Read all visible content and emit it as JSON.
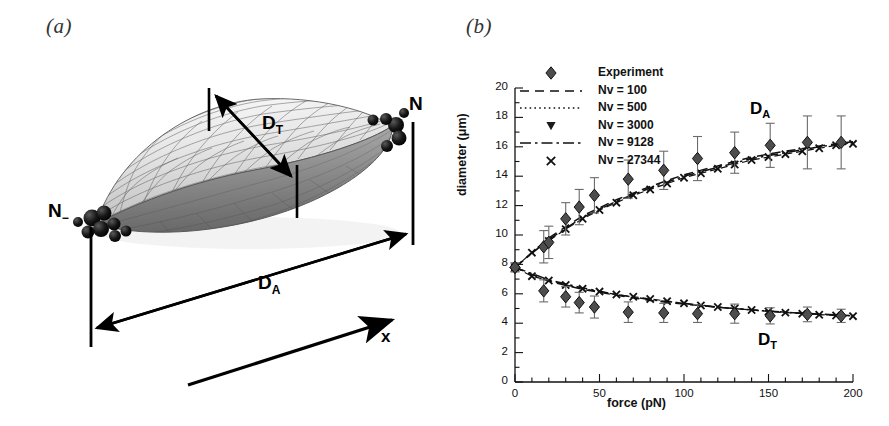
{
  "figure": {
    "panel_a_label": "(a)",
    "panel_b_label": "(b)"
  },
  "panel_a": {
    "caption": "3D triangulated mesh of a stretched cell (ellipsoidal/spindle membrane surface) with attached bead clusters at both poles",
    "labels": {
      "node_right": "N",
      "node_right_sub": "+",
      "node_left": "N",
      "node_left_sub": "−",
      "transverse_diameter": "D",
      "transverse_diameter_sub": "T",
      "axial_diameter": "D",
      "axial_diameter_sub": "A",
      "axis_arrow": "x"
    },
    "colors": {
      "mesh_line": "#4a4a4a",
      "surface_light": "#f2f2f2",
      "surface_mid": "#c8c8c8",
      "surface_dark": "#777777",
      "bead": "#111111",
      "arrow": "#000000"
    }
  },
  "chart_data": {
    "type": "scatter",
    "title": "",
    "xlabel": "force (pN)",
    "ylabel": "diameter (μm)",
    "xlim": [
      0,
      200
    ],
    "ylim": [
      0,
      20
    ],
    "xticks": [
      0,
      50,
      100,
      150,
      200
    ],
    "xticklabels": [
      "0",
      "50",
      "100",
      "150",
      "200"
    ],
    "xminor_step": 10,
    "yticks": [
      0,
      2,
      4,
      6,
      8,
      10,
      12,
      14,
      16,
      18,
      20
    ],
    "yticklabels": [
      "0",
      "2",
      "4",
      "6",
      "8",
      "10",
      "12",
      "14",
      "16",
      "18",
      "20"
    ],
    "yminor_step": 1,
    "grid": false,
    "legend_position": "top-left",
    "annotations": [
      {
        "text": "D",
        "sub": "A",
        "x": 150,
        "y": 18.4
      },
      {
        "text": "D",
        "sub": "T",
        "x": 155,
        "y": 2.6
      }
    ],
    "legend": [
      {
        "label": "Experiment",
        "marker": "diamond",
        "linestyle": "none"
      },
      {
        "label": "Nv = 100",
        "marker": "none",
        "linestyle": "dashed"
      },
      {
        "label": "Nv = 500",
        "marker": "none",
        "linestyle": "dotted"
      },
      {
        "label": "Nv = 3000",
        "marker": "triangle-down",
        "linestyle": "none"
      },
      {
        "label": "Nv = 9128",
        "marker": "none",
        "linestyle": "dashdot"
      },
      {
        "label": "Nv = 27344",
        "marker": "x",
        "linestyle": "none"
      }
    ],
    "series": [
      {
        "name": "D_A Experiment",
        "marker": "diamond",
        "branch": "axial",
        "x": [
          0,
          17,
          20,
          30,
          38,
          47,
          67,
          88,
          108,
          130,
          151,
          173,
          193
        ],
        "y": [
          7.8,
          9.2,
          9.5,
          11.1,
          11.9,
          12.7,
          13.8,
          14.4,
          15.2,
          15.6,
          16.1,
          16.3,
          16.3
        ],
        "yerr": [
          0.3,
          1.1,
          1.1,
          1.1,
          1.2,
          1.2,
          1.3,
          1.3,
          1.5,
          1.4,
          1.5,
          1.8,
          1.8
        ]
      },
      {
        "name": "D_T Experiment",
        "marker": "diamond",
        "branch": "transverse",
        "x": [
          0,
          17,
          30,
          38,
          47,
          67,
          88,
          108,
          130,
          151,
          173,
          193
        ],
        "y": [
          7.8,
          6.2,
          5.8,
          5.4,
          5.1,
          4.75,
          4.7,
          4.65,
          4.65,
          4.5,
          4.6,
          4.5
        ],
        "yerr": [
          0.3,
          0.75,
          0.7,
          0.7,
          0.75,
          0.7,
          0.65,
          0.6,
          0.65,
          0.55,
          0.5,
          0.45
        ]
      },
      {
        "name": "D_A Nv = 27344",
        "marker": "x",
        "branch": "axial",
        "x": [
          0,
          10,
          20,
          30,
          40,
          50,
          60,
          70,
          80,
          90,
          100,
          110,
          120,
          130,
          140,
          150,
          160,
          170,
          180,
          190,
          200
        ],
        "y": [
          7.8,
          8.8,
          9.6,
          10.4,
          11.1,
          11.7,
          12.2,
          12.7,
          13.1,
          13.5,
          13.9,
          14.2,
          14.5,
          14.8,
          15.1,
          15.3,
          15.5,
          15.7,
          15.9,
          16.1,
          16.2
        ]
      },
      {
        "name": "D_T Nv = 27344",
        "marker": "x",
        "branch": "transverse",
        "x": [
          0,
          10,
          20,
          30,
          40,
          50,
          60,
          70,
          80,
          90,
          100,
          110,
          120,
          130,
          140,
          150,
          160,
          170,
          180,
          190,
          200
        ],
        "y": [
          7.8,
          7.2,
          6.9,
          6.6,
          6.35,
          6.15,
          5.95,
          5.8,
          5.65,
          5.5,
          5.35,
          5.2,
          5.1,
          5.0,
          4.9,
          4.8,
          4.72,
          4.65,
          4.58,
          4.52,
          4.48
        ]
      },
      {
        "name": "D_A Nv = 9128",
        "marker": "none",
        "linestyle": "dashdot",
        "branch": "axial",
        "x": [
          0,
          20,
          40,
          60,
          80,
          100,
          120,
          140,
          160,
          180,
          200
        ],
        "y": [
          7.8,
          9.7,
          11.2,
          12.3,
          13.2,
          14.0,
          14.6,
          15.2,
          15.6,
          16.0,
          16.3
        ]
      },
      {
        "name": "D_T Nv = 9128",
        "marker": "none",
        "linestyle": "dashdot",
        "branch": "transverse",
        "x": [
          0,
          20,
          40,
          60,
          80,
          100,
          120,
          140,
          160,
          180,
          200
        ],
        "y": [
          7.8,
          6.95,
          6.4,
          5.95,
          5.6,
          5.35,
          5.1,
          4.9,
          4.75,
          4.6,
          4.5
        ]
      },
      {
        "name": "D_A Nv = 100",
        "marker": "none",
        "linestyle": "dashed",
        "branch": "axial",
        "x": [
          0,
          20,
          40,
          60,
          80,
          100,
          120,
          140,
          160,
          180,
          200
        ],
        "y": [
          7.8,
          9.8,
          11.3,
          12.4,
          13.3,
          14.1,
          14.7,
          15.3,
          15.7,
          16.05,
          16.35
        ]
      },
      {
        "name": "D_T Nv = 100",
        "marker": "none",
        "linestyle": "dashed",
        "branch": "transverse",
        "x": [
          0,
          20,
          40,
          60,
          80,
          100,
          120,
          140,
          160,
          180,
          200
        ],
        "y": [
          7.8,
          6.85,
          6.3,
          5.9,
          5.55,
          5.3,
          5.08,
          4.9,
          4.75,
          4.62,
          4.52
        ]
      }
    ]
  }
}
